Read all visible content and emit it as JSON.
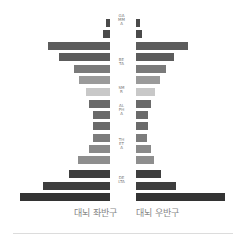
{
  "chart_data": {
    "type": "bar",
    "orientation": "horizontal-butterfly",
    "title": "",
    "series": [
      {
        "name": "대뇌 좌반구",
        "values": [
          4,
          7,
          62,
          51,
          36,
          31,
          24,
          21,
          17,
          17,
          17,
          21,
          32,
          41,
          67,
          90
        ]
      },
      {
        "name": "대뇌 우반구",
        "values": [
          4,
          6,
          52,
          38,
          30,
          24,
          19,
          15,
          12,
          12,
          11,
          15,
          18,
          25,
          40,
          89
        ]
      }
    ],
    "row_colors": [
      "#4a4a4a",
      "#4a4a4a",
      "#5c5c5c",
      "#5c5c5c",
      "#7a7a7a",
      "#9a9a9a",
      "#c8c8c8",
      "#6a6a6a",
      "#6a6a6a",
      "#6a6a6a",
      "#7c7c7c",
      "#8a8a8a",
      "#8e8e8e",
      "#3e3e3e",
      "#3e3e3e",
      "#333333"
    ],
    "band_labels": [
      {
        "label": "GAMMA",
        "rows": [
          0,
          1
        ]
      },
      {
        "label": "BETA",
        "rows": [
          2,
          5
        ]
      },
      {
        "label": "SMR",
        "rows": [
          6,
          6
        ]
      },
      {
        "label": "ALPHA",
        "rows": [
          7,
          9
        ]
      },
      {
        "label": "THETA",
        "rows": [
          10,
          12
        ]
      },
      {
        "label": "DELTA",
        "rows": [
          13,
          15
        ]
      }
    ],
    "xlabel_left": "대뇌 좌반구",
    "xlabel_right": "대뇌 우반구",
    "grid": false,
    "legend": "none"
  },
  "labels": {
    "gamma": "GAMMA",
    "beta": "BETA",
    "smr": "SMR",
    "alpha": "ALPHA",
    "theta": "THETA",
    "delta": "DELTA",
    "left_hemisphere": "대뇌 좌반구",
    "right_hemisphere": "대뇌 우반구"
  }
}
